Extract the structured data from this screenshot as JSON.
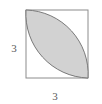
{
  "figure": {
    "background_color": "#ffffff",
    "square": {
      "name": "square",
      "side_label": "3",
      "x": 26,
      "y": 10,
      "width": 62,
      "height": 68,
      "stroke_color": "#8c8c8c",
      "stroke_width": 1,
      "fill": "none"
    },
    "lens": {
      "name": "shaded-lens-region",
      "fill_color": "#d2d2d2",
      "stroke_color": "#7a7a7a",
      "stroke_width": 1,
      "description": "Vesica formed by two quarter-circle arcs of radius 3 drawn from the top-right and bottom-left corners of the square"
    },
    "outer_arc": {
      "name": "outer-quarter-arc",
      "stroke_color": "#9a9a9a",
      "stroke_width": 1,
      "description": "Quarter circle of radius 3 centred at the top-right corner, from the top-left corner to the bottom-right corner"
    },
    "labels": [
      {
        "name": "side-label-left",
        "text": "3",
        "x": 14,
        "y": 49,
        "color": "#5a5a5a"
      },
      {
        "name": "side-label-bottom",
        "text": "3",
        "x": 55,
        "y": 97,
        "color": "#5a5a5a"
      }
    ]
  }
}
